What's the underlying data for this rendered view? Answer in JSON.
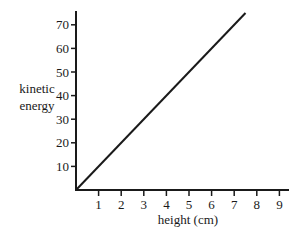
{
  "chart_data": {
    "type": "line",
    "title": "",
    "xlabel": "height (cm)",
    "ylabel": "kinetic energy",
    "ylabel_lines": [
      "kinetic",
      "energy"
    ],
    "x_ticks": [
      "1",
      "2",
      "3",
      "4",
      "5",
      "6",
      "7",
      "8",
      "9"
    ],
    "y_ticks": [
      "10",
      "20",
      "30",
      "40",
      "50",
      "60",
      "70"
    ],
    "xlim": [
      0,
      9.5
    ],
    "ylim": [
      0,
      76
    ],
    "grid": false,
    "legend": null,
    "series": [
      {
        "name": "kinetic energy vs height",
        "x": [
          0,
          7.5
        ],
        "y": [
          0,
          75
        ],
        "color": "#1a1a1a"
      }
    ]
  }
}
